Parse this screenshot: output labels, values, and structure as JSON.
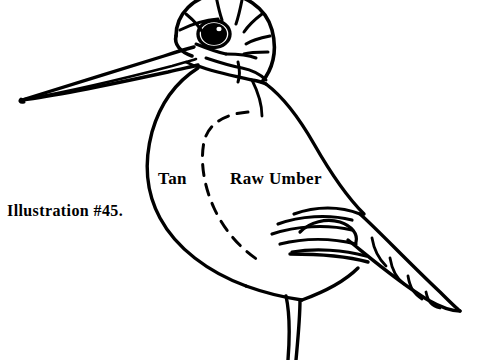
{
  "page": {
    "background_color": "#ffffff",
    "ink_color": "#000000",
    "width": 477,
    "height": 360
  },
  "illustration": {
    "subject": "shorebird-line-drawing",
    "caption": "Illustration #45.",
    "color_annotations": [
      {
        "name": "tan-region-label",
        "label": "Tan"
      },
      {
        "name": "raw-umber-region-label",
        "label": "Raw Umber"
      }
    ],
    "parts": [
      "long-pointed-beak",
      "striped-head",
      "black-eye",
      "breast",
      "wing",
      "barred-tail",
      "legs"
    ]
  }
}
